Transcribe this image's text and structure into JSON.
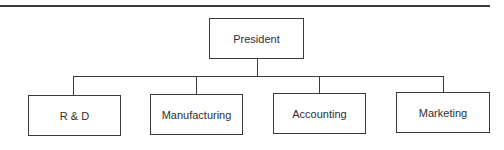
{
  "diagram": {
    "type": "org-chart",
    "root": {
      "label": "President"
    },
    "children": [
      {
        "label": "R & D"
      },
      {
        "label": "Manufacturing"
      },
      {
        "label": "Accounting"
      },
      {
        "label": "Marketing"
      }
    ],
    "colors": {
      "line": "#3a3a3a",
      "box_fill": "#ffffff",
      "text": "#2f2f2f"
    }
  }
}
